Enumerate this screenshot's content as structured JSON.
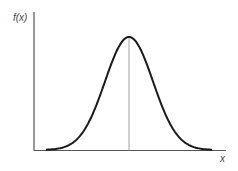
{
  "chart_data": {
    "type": "line",
    "title": "",
    "xlabel": "x",
    "ylabel": "f(x)",
    "grid": false,
    "legend": null,
    "series": [
      {
        "name": "f(x)",
        "shape": "gaussian",
        "mean_position_fraction": 0.5,
        "peak_height_fraction": 0.82
      }
    ],
    "annotations": [
      {
        "type": "vline",
        "at": "mean",
        "label": ""
      }
    ]
  },
  "labels": {
    "y_axis": "f(x)",
    "x_axis": "x"
  },
  "colors": {
    "curve": "#1a1a1a",
    "axes": "#555555",
    "mean_line": "#888888"
  }
}
